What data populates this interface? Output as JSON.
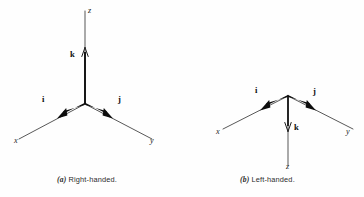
{
  "figure": {
    "background_color": "#fefefe",
    "ink_color": "#1c1c1c",
    "vector_color": "#0d0d0d",
    "panels": [
      {
        "id": "a",
        "tag": "(a)",
        "caption": "Right-handed.",
        "handedness": "right",
        "origin": {
          "x": 85,
          "y": 104
        },
        "axes": [
          {
            "name": "x",
            "label": "x",
            "direction": "down-left",
            "tip": {
              "x": 18,
              "y": 140
            }
          },
          {
            "name": "y",
            "label": "y",
            "direction": "down-right",
            "tip": {
              "x": 153,
              "y": 140
            }
          },
          {
            "name": "z",
            "label": "z",
            "direction": "up",
            "tip": {
              "x": 85,
              "y": 10
            }
          }
        ],
        "vectors": [
          {
            "name": "i",
            "label": "i",
            "along_axis": "x",
            "arrow_direction": "down-left",
            "tip": {
              "x": 61,
              "y": 117
            }
          },
          {
            "name": "j",
            "label": "j",
            "along_axis": "y",
            "arrow_direction": "down-right",
            "tip": {
              "x": 111,
              "y": 117
            }
          },
          {
            "name": "k",
            "label": "k",
            "along_axis": "z",
            "arrow_direction": "up",
            "tip": {
              "x": 85,
              "y": 50
            }
          }
        ]
      },
      {
        "id": "b",
        "tag": "(b)",
        "caption": "Left-handed.",
        "handedness": "left",
        "origin": {
          "x": 288,
          "y": 96
        },
        "axes": [
          {
            "name": "x",
            "label": "x",
            "direction": "down-left",
            "tip": {
              "x": 222,
              "y": 130
            }
          },
          {
            "name": "y",
            "label": "y",
            "direction": "down-right",
            "tip": {
              "x": 352,
              "y": 130
            }
          },
          {
            "name": "z",
            "label": "z",
            "direction": "down",
            "tip": {
              "x": 288,
              "y": 166
            }
          }
        ],
        "vectors": [
          {
            "name": "i",
            "label": "i",
            "along_axis": "x",
            "arrow_direction": "down-left",
            "tip": {
              "x": 263,
              "y": 109
            }
          },
          {
            "name": "j",
            "label": "j",
            "along_axis": "y",
            "arrow_direction": "down-right",
            "tip": {
              "x": 313,
              "y": 109
            }
          },
          {
            "name": "k",
            "label": "k",
            "along_axis": "z",
            "arrow_direction": "down",
            "tip": {
              "x": 288,
              "y": 130
            }
          }
        ]
      }
    ]
  }
}
